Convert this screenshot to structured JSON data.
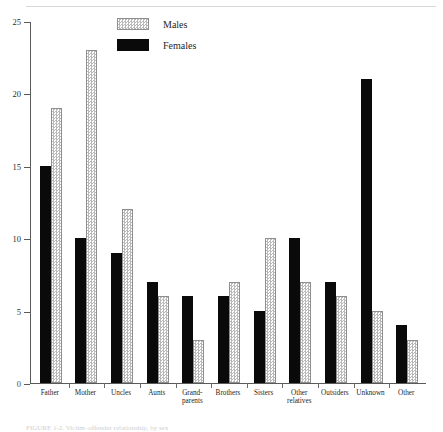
{
  "figure": {
    "caption": "FIGURE 1-2. Victim–offender relationship, by sex"
  },
  "legend": {
    "position": "top-center",
    "entries": [
      {
        "label": "Males",
        "swatch": "male",
        "color": "#b9b9b9"
      },
      {
        "label": "Females",
        "swatch": "female",
        "color": "#0a0a0a"
      }
    ]
  },
  "chart_data": {
    "type": "bar",
    "title": "",
    "subtitle": "",
    "xlabel": "",
    "ylabel": "",
    "ylim": [
      0,
      25
    ],
    "yticks": [
      0,
      5,
      10,
      15,
      20,
      25
    ],
    "ytick_labels": [
      "0",
      "5",
      "10",
      "15",
      "20",
      "25"
    ],
    "grid": false,
    "legend_position": "top-center",
    "categories": [
      "Father",
      "Mother",
      "Uncles",
      "Aunts",
      "Grand-\nparents",
      "Brothers",
      "Sisters",
      "Other\nrelatives",
      "Outsiders",
      "Unknown",
      "Other"
    ],
    "series": [
      {
        "name": "Females",
        "color": "#0a0a0a",
        "values": [
          15,
          10,
          9,
          7,
          6,
          6,
          5,
          10,
          7,
          21,
          4
        ]
      },
      {
        "name": "Males",
        "color": "#b9b9b9",
        "values": [
          19,
          23,
          12,
          6,
          3,
          7,
          10,
          7,
          6,
          5,
          3
        ]
      }
    ]
  }
}
